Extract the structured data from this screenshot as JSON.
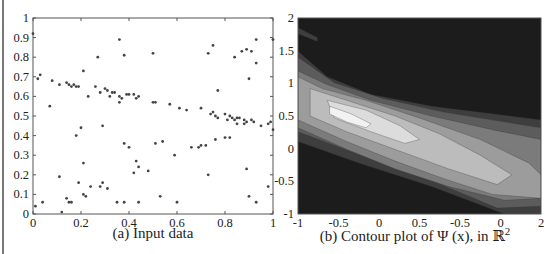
{
  "chart_data": [
    {
      "type": "scatter",
      "title": "",
      "caption": "(a) Input data",
      "xlabel": "",
      "ylabel": "",
      "xlim": [
        0,
        1
      ],
      "ylim": [
        0,
        1
      ],
      "grid": false,
      "legend": null,
      "x_ticks": [
        "0",
        "0.2",
        "0.4",
        "0.6",
        "0.8",
        "1"
      ],
      "y_ticks": [
        "0",
        "0.1",
        "0.2",
        "0.3",
        "0.4",
        "0.5",
        "0.6",
        "0.7",
        "0.8",
        "0.9",
        "1"
      ],
      "marker_color": "#444444",
      "points": [
        [
          0.0,
          0.92
        ],
        [
          0.01,
          0.04
        ],
        [
          0.03,
          0.71
        ],
        [
          0.02,
          0.69
        ],
        [
          0.04,
          0.06
        ],
        [
          0.07,
          0.55
        ],
        [
          0.08,
          0.68
        ],
        [
          0.11,
          0.19
        ],
        [
          0.11,
          0.66
        ],
        [
          0.12,
          0.01
        ],
        [
          0.14,
          0.08
        ],
        [
          0.14,
          0.67
        ],
        [
          0.15,
          0.06
        ],
        [
          0.15,
          0.66
        ],
        [
          0.16,
          0.06
        ],
        [
          0.16,
          0.65
        ],
        [
          0.17,
          0.66
        ],
        [
          0.18,
          0.4
        ],
        [
          0.18,
          0.65
        ],
        [
          0.19,
          0.65
        ],
        [
          0.19,
          0.16
        ],
        [
          0.2,
          0.44
        ],
        [
          0.21,
          0.73
        ],
        [
          0.21,
          0.26
        ],
        [
          0.21,
          0.1
        ],
        [
          0.22,
          0.09
        ],
        [
          0.23,
          0.6
        ],
        [
          0.24,
          0.14
        ],
        [
          0.26,
          0.65
        ],
        [
          0.27,
          0.8
        ],
        [
          0.28,
          0.62
        ],
        [
          0.28,
          0.14
        ],
        [
          0.29,
          0.16
        ],
        [
          0.29,
          0.45
        ],
        [
          0.3,
          0.64
        ],
        [
          0.31,
          0.63
        ],
        [
          0.31,
          0.13
        ],
        [
          0.32,
          0.6
        ],
        [
          0.33,
          0.62
        ],
        [
          0.34,
          0.62
        ],
        [
          0.35,
          0.06
        ],
        [
          0.36,
          0.89
        ],
        [
          0.36,
          0.6
        ],
        [
          0.36,
          0.57
        ],
        [
          0.37,
          0.59
        ],
        [
          0.38,
          0.81
        ],
        [
          0.38,
          0.06
        ],
        [
          0.38,
          0.36
        ],
        [
          0.39,
          0.61
        ],
        [
          0.4,
          0.61
        ],
        [
          0.4,
          0.34
        ],
        [
          0.42,
          0.61
        ],
        [
          0.42,
          0.21
        ],
        [
          0.43,
          0.27
        ],
        [
          0.43,
          0.59
        ],
        [
          0.44,
          0.06
        ],
        [
          0.44,
          0.6
        ],
        [
          0.44,
          0.24
        ],
        [
          0.48,
          0.22
        ],
        [
          0.5,
          0.57
        ],
        [
          0.5,
          0.82
        ],
        [
          0.51,
          0.57
        ],
        [
          0.51,
          0.36
        ],
        [
          0.53,
          0.09
        ],
        [
          0.54,
          0.37
        ],
        [
          0.57,
          0.56
        ],
        [
          0.59,
          0.3
        ],
        [
          0.6,
          0.06
        ],
        [
          0.61,
          0.54
        ],
        [
          0.64,
          0.53
        ],
        [
          0.66,
          0.34
        ],
        [
          0.69,
          0.34
        ],
        [
          0.7,
          0.35
        ],
        [
          0.7,
          0.54
        ],
        [
          0.72,
          0.35
        ],
        [
          0.73,
          0.82
        ],
        [
          0.73,
          0.2
        ],
        [
          0.74,
          0.51
        ],
        [
          0.75,
          0.52
        ],
        [
          0.75,
          0.86
        ],
        [
          0.76,
          0.38
        ],
        [
          0.76,
          0.5
        ],
        [
          0.77,
          0.49
        ],
        [
          0.77,
          0.63
        ],
        [
          0.8,
          0.51
        ],
        [
          0.8,
          0.39
        ],
        [
          0.81,
          0.48
        ],
        [
          0.82,
          0.39
        ],
        [
          0.82,
          0.5
        ],
        [
          0.83,
          0.49
        ],
        [
          0.84,
          0.8
        ],
        [
          0.84,
          0.48
        ],
        [
          0.85,
          0.46
        ],
        [
          0.85,
          0.49
        ],
        [
          0.86,
          0.49
        ],
        [
          0.87,
          0.83
        ],
        [
          0.88,
          0.46
        ],
        [
          0.88,
          0.48
        ],
        [
          0.89,
          0.84
        ],
        [
          0.89,
          0.47
        ],
        [
          0.89,
          0.23
        ],
        [
          0.9,
          0.69
        ],
        [
          0.9,
          0.09
        ],
        [
          0.91,
          0.48
        ],
        [
          0.91,
          0.83
        ],
        [
          0.92,
          0.47
        ],
        [
          0.93,
          0.77
        ],
        [
          0.93,
          0.89
        ],
        [
          0.93,
          0.06
        ],
        [
          0.95,
          0.45
        ],
        [
          0.98,
          0.46
        ],
        [
          0.98,
          0.14
        ],
        [
          0.99,
          0.47
        ],
        [
          1.0,
          0.43
        ],
        [
          1.0,
          0.89
        ]
      ]
    },
    {
      "type": "heatmap",
      "subtype": "filled-contour",
      "title": "",
      "caption": "(b) Contour plot of Ψ (x), in ℝ²",
      "caption_parts": {
        "main": "(b) Contour plot of Ψ (x), in ℝ",
        "sup": "2"
      },
      "xlabel": "",
      "ylabel": "",
      "xlim": [
        -1,
        2
      ],
      "ylim": [
        -1,
        2
      ],
      "grid": false,
      "legend": null,
      "x_ticks": [
        "-1",
        "-0.5",
        "0",
        "0.5",
        "-0.5",
        "0",
        "2"
      ],
      "y_ticks": [
        "-1",
        "-0.5",
        "0",
        "0.5",
        "1",
        "1.5",
        "2"
      ],
      "colormap": "grayscale",
      "levels_colors": [
        "#1c1c1c",
        "#3e3e3e",
        "#5c5c5c",
        "#7b7b7b",
        "#9c9c9c",
        "#bcbcbc",
        "#dcdcdc",
        "#f2f2f2"
      ],
      "description": "Dark background with a light diagonal band running from upper-left (~y=1 at x=-1) to lower-right (~y=-1 at x=2); brightest peak elongated around x≈-0.5..0, y≈0.5..0.85"
    }
  ]
}
